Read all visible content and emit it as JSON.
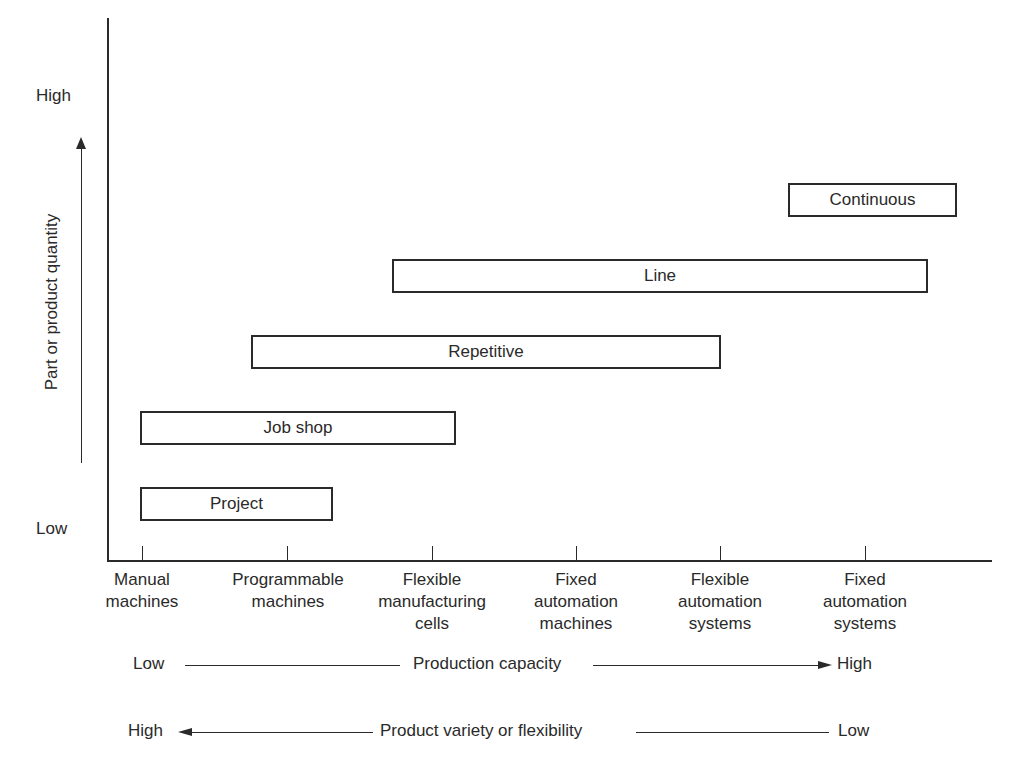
{
  "diagram": {
    "y_axis": {
      "title": "Part or product quantity",
      "high_label": "High",
      "low_label": "Low"
    },
    "x_axis": {
      "categories": [
        "Manual\nmachines",
        "Programmable\nmachines",
        "Flexible\nmanufacturing\ncells",
        "Fixed\nautomation\nmachines",
        "Flexible\nautomation\nsystems",
        "Fixed\nautomation\nsystems"
      ]
    },
    "process_types": [
      {
        "label": "Project",
        "start": "Manual machines",
        "end": "Programmable machines (~+0.3)"
      },
      {
        "label": "Job shop",
        "start": "Manual machines",
        "end": "Flexible manufacturing cells (~+0.15)"
      },
      {
        "label": "Repetitive",
        "start": "Programmable machines (~-0.25)",
        "end": "Flexible automation systems"
      },
      {
        "label": "Line",
        "start": "Flexible manufacturing cells (~-0.25)",
        "end": "Fixed automation systems (~+0.45)"
      },
      {
        "label": "Continuous",
        "start": "Fixed automation systems (~-0.5)",
        "end": "beyond Fixed automation systems (~+0.65)"
      }
    ],
    "bottom_scales": [
      {
        "left": "Low",
        "label": "Production capacity",
        "right": "High",
        "direction": "right"
      },
      {
        "left": "High",
        "label": "Product variety or flexibility",
        "right": "Low",
        "direction": "left"
      }
    ]
  }
}
